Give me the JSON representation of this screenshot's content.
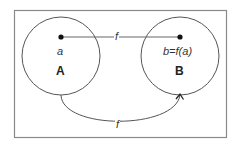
{
  "diagram": {
    "type": "function-mapping",
    "frame": {
      "x": 14,
      "y": 10,
      "width": 213,
      "height": 128,
      "color": "#8a8a8a"
    },
    "sets": [
      {
        "id": "A",
        "label": "A",
        "element": "a",
        "cx": 61,
        "cy": 56,
        "r": 39
      },
      {
        "id": "B",
        "label": "B",
        "element": "b=f(a)",
        "cx": 180,
        "cy": 56,
        "r": 39
      }
    ],
    "mapping": {
      "direct_label": "f",
      "curved_label": "f"
    },
    "colors": {
      "stroke": "#555555",
      "dot": "#111111",
      "text": "#333333"
    }
  }
}
